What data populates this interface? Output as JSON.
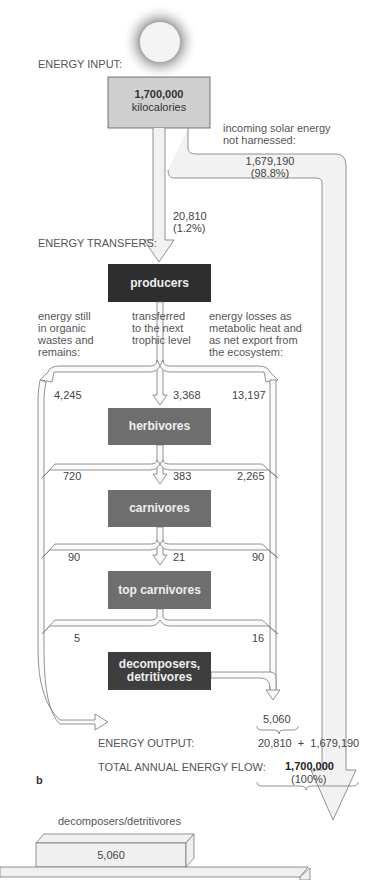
{
  "header": {
    "energy_input_label": "ENERGY INPUT:",
    "input_value": "1,700,000",
    "input_unit": "kilocalories",
    "not_harnessed_label_1": "incoming solar energy",
    "not_harnessed_label_2": "not harnessed:",
    "not_harnessed_value": "1,679,190",
    "not_harnessed_pct": "(98.8%)",
    "harnessed_value": "20,810",
    "harnessed_pct": "(1.2%)",
    "energy_transfers_label": "ENERGY TRANSFERS:"
  },
  "columns": {
    "left_1": "energy still",
    "left_2": "in organic",
    "left_3": "wastes and",
    "left_4": "remains:",
    "mid_1": "transferred",
    "mid_2": "to the next",
    "mid_3": "trophic level",
    "right_1": "energy losses as",
    "right_2": "metabolic heat and",
    "right_3": "as net export from",
    "right_4": "the ecosystem:"
  },
  "levels": {
    "producers": "producers",
    "herbivores": "herbivores",
    "carnivores": "carnivores",
    "top_carnivores": "top carnivores",
    "decomposers_1": "decomposers,",
    "decomposers_2": "detritivores"
  },
  "flows": {
    "p_waste": "4,245",
    "p_next": "3,368",
    "p_loss": "13,197",
    "h_waste": "720",
    "h_next": "383",
    "h_loss": "2,265",
    "c_waste": "90",
    "c_next": "21",
    "c_loss": "90",
    "t_waste": "5",
    "t_loss": "16"
  },
  "output": {
    "decomposer_total": "5,060",
    "energy_output_label": "ENERGY OUTPUT:",
    "output_sum": "20,810  +  1,679,190",
    "total_label": "TOTAL ANNUAL ENERGY FLOW:",
    "total_value": "1,700,000",
    "total_pct": "(100%)",
    "panel_label": "b"
  },
  "pyramid": {
    "top_label": "decomposers/detritivores",
    "top_value": "5,060"
  },
  "colors": {
    "producers": "#2e2e2e",
    "trophic": "#6e6e6e",
    "input_box": "#cfcfcf",
    "arrow_fill": "#f2f2f2"
  }
}
